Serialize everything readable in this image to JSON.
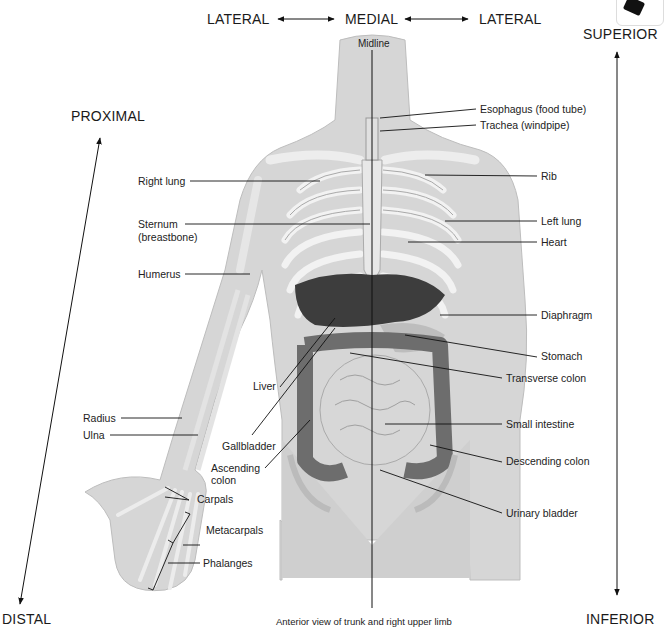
{
  "directions": {
    "lateral_left": "LATERAL",
    "medial": "MEDIAL",
    "lateral_right": "LATERAL",
    "superior": "SUPERIOR",
    "inferior": "INFERIOR",
    "proximal": "PROXIMAL",
    "distal": "DISTAL",
    "midline": "Midline"
  },
  "labels_right": [
    {
      "text": "Esophagus (food tube)"
    },
    {
      "text": "Trachea (windpipe)"
    },
    {
      "text": "Rib"
    },
    {
      "text": "Left lung"
    },
    {
      "text": "Heart"
    },
    {
      "text": "Diaphragm"
    },
    {
      "text": "Stomach"
    },
    {
      "text": "Transverse colon"
    },
    {
      "text": "Small intestine"
    },
    {
      "text": "Descending colon"
    },
    {
      "text": "Urinary bladder"
    }
  ],
  "labels_left": [
    {
      "text": "Right lung"
    },
    {
      "text": "Sternum"
    },
    {
      "text": "(breastbone)"
    },
    {
      "text": "Humerus"
    },
    {
      "text": "Liver"
    },
    {
      "text": "Radius"
    },
    {
      "text": "Ulna"
    },
    {
      "text": "Gallbladder"
    },
    {
      "text": "Ascending"
    },
    {
      "text": "colon"
    },
    {
      "text": "Carpals"
    },
    {
      "text": "Metacarpals"
    },
    {
      "text": "Phalanges"
    }
  ],
  "caption": "Anterior view of trunk and right upper limb",
  "colors": {
    "skin": "#d9d9d9",
    "bone": "#ececec",
    "organ_dark": "#3a3a3a",
    "organ_mid": "#8a8a8a",
    "line": "#111111"
  }
}
